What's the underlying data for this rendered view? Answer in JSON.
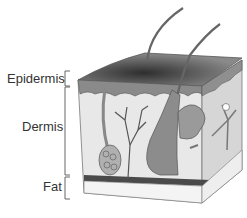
{
  "diagram": {
    "layers": [
      {
        "label": "Epidermis"
      },
      {
        "label": "Dermis"
      },
      {
        "label": "Fat"
      }
    ],
    "colors": {
      "background": "#ffffff",
      "epidermis_top": "#6a6a6a",
      "epidermis_dark": "#3a3a3a",
      "dermis": "#e6e6e6",
      "dermis_side": "#d4d4d4",
      "structures": "#7a7a7a",
      "fat_band": "#4a4a4a",
      "fat": "#f2f2f2",
      "text": "#333333"
    }
  }
}
